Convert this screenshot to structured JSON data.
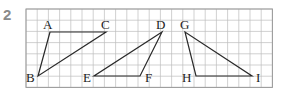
{
  "problem_number": "2",
  "grid": {
    "x0": 26,
    "y0": 9,
    "cell": 11.2,
    "cols": 22,
    "rows": 7,
    "line_color": "#bdbdbd",
    "border_color": "#9a9a9a"
  },
  "triangles": [
    {
      "name": "triangle-abc",
      "vertices": [
        {
          "label": "A",
          "x": 50,
          "y": 32,
          "lx": 43,
          "ly": 29
        },
        {
          "label": "B",
          "x": 38,
          "y": 76,
          "lx": 26,
          "ly": 82
        },
        {
          "label": "C",
          "x": 106,
          "y": 32,
          "lx": 101,
          "ly": 29
        }
      ]
    },
    {
      "name": "triangle-def",
      "vertices": [
        {
          "label": "D",
          "x": 162,
          "y": 32,
          "lx": 156,
          "ly": 29
        },
        {
          "label": "E",
          "x": 94,
          "y": 76,
          "lx": 83,
          "ly": 82
        },
        {
          "label": "F",
          "x": 140,
          "y": 76,
          "lx": 145,
          "ly": 82
        }
      ]
    },
    {
      "name": "triangle-ghi",
      "vertices": [
        {
          "label": "G",
          "x": 185,
          "y": 32,
          "lx": 180,
          "ly": 29
        },
        {
          "label": "H",
          "x": 196,
          "y": 76,
          "lx": 182,
          "ly": 82
        },
        {
          "label": "I",
          "x": 252,
          "y": 76,
          "lx": 256,
          "ly": 82
        }
      ]
    }
  ],
  "stroke_color": "#2a2a2a"
}
